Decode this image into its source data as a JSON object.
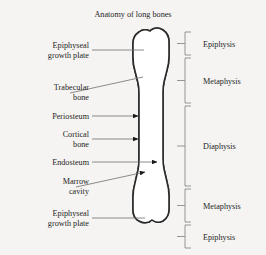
{
  "title": "Anatomy of long bones",
  "background_color": "#f5f4f2",
  "text_color": "#1f1f1f",
  "leader_line_color": "#6e6e6e",
  "bracket_color": "#8a8a8a",
  "bone_outline_color": "#2a2a2a",
  "trabecular_fill_color": "#111111",
  "left_labels": [
    {
      "id": "epiphyseal-growth-plate-top",
      "line1": "Epiphyseal",
      "line2": "growth plate"
    },
    {
      "id": "trabecular-bone",
      "line1": "Trabecular",
      "line2": "bone"
    },
    {
      "id": "periosteum",
      "line1": "Periosteum",
      "line2": ""
    },
    {
      "id": "cortical-bone",
      "line1": "Cortical",
      "line2": "bone"
    },
    {
      "id": "endosteum",
      "line1": "Endosteum",
      "line2": ""
    },
    {
      "id": "marrow-cavity",
      "line1": "Marrow",
      "line2": "cavity"
    },
    {
      "id": "epiphyseal-growth-plate-bottom",
      "line1": "Epiphyseal",
      "line2": "growth plate"
    }
  ],
  "right_brackets": [
    {
      "id": "epiphysis-proximal",
      "label": "Epiphysis"
    },
    {
      "id": "metaphysis-proximal",
      "label": "Metaphysis"
    },
    {
      "id": "diaphysis",
      "label": "Diaphysis"
    },
    {
      "id": "metaphysis-distal",
      "label": "Metaphysis"
    },
    {
      "id": "epiphysis-distal",
      "label": "Epiphysis"
    }
  ]
}
